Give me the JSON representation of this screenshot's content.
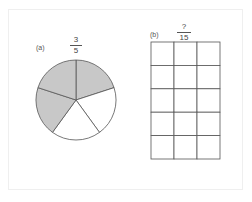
{
  "panel_a": {
    "label": "(a)",
    "fraction": {
      "numerator": "3",
      "denominator": "5"
    },
    "pie": {
      "total_parts": 5,
      "shaded_parts": 3,
      "shaded_indices": [
        0,
        3,
        4
      ]
    }
  },
  "panel_b": {
    "label": "(b)",
    "fraction": {
      "numerator": "?",
      "denominator": "15"
    },
    "grid": {
      "columns": 3,
      "rows": 5
    }
  },
  "colors": {
    "shade": "#c8c8c8",
    "stroke": "#555555",
    "empty": "#ffffff"
  }
}
